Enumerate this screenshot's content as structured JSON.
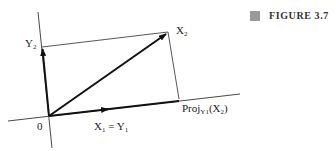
{
  "figure": {
    "caption": "FIGURE 3.7",
    "caption_marker_color": "#9a9a9a"
  },
  "labels": {
    "origin": "0",
    "y2": {
      "base": "Y",
      "sub": "2"
    },
    "x2": {
      "base": "X",
      "sub": "2"
    },
    "x1_eq_y1": {
      "left_base": "X",
      "left_sub": "1",
      "eq": " = ",
      "right_base": "Y",
      "right_sub": "1"
    },
    "proj": {
      "base": "Proj",
      "sub": "Y1",
      "arg_open": "(X",
      "arg_sub": "2",
      "arg_close": ")"
    }
  },
  "geometry": {
    "origin": [
      49,
      116
    ],
    "vectors": [
      {
        "name": "Y2",
        "from": [
          49,
          116
        ],
        "to": [
          42,
          48
        ]
      },
      {
        "name": "X2",
        "from": [
          49,
          116
        ],
        "to": [
          167,
          33
        ]
      },
      {
        "name": "X1=Y1",
        "from": [
          49,
          116
        ],
        "to": [
          108,
          109
        ]
      }
    ],
    "lines": [
      {
        "name": "vertical-axis",
        "from": [
          38,
          12
        ],
        "to": [
          52,
          148
        ]
      },
      {
        "name": "horizontal-axis",
        "from": [
          8,
          121
        ],
        "to": [
          240,
          94
        ]
      },
      {
        "name": "top-edge",
        "from": [
          42,
          47
        ],
        "to": [
          168,
          32
        ]
      },
      {
        "name": "right-edge",
        "from": [
          168,
          32
        ],
        "to": [
          179,
          99
        ]
      }
    ]
  }
}
